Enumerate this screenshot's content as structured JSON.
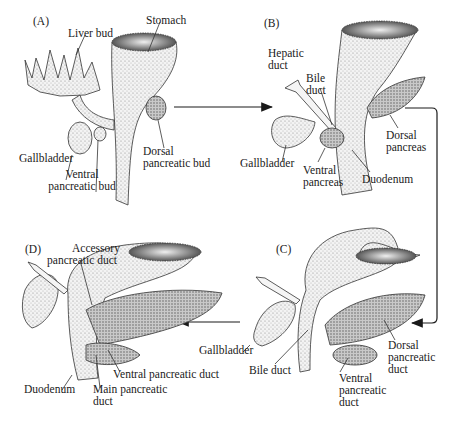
{
  "figure": {
    "panels": [
      {
        "id": "A",
        "label": "(A)",
        "annotations": {
          "liver_bud": "Liver bud",
          "stomach": "Stomach",
          "gallbladder": "Gallbladder",
          "ventral_bud_1": "Ventral",
          "ventral_bud_2": "pancreatic bud",
          "dorsal_bud_1": "Dorsal",
          "dorsal_bud_2": "pancreatic bud"
        }
      },
      {
        "id": "B",
        "label": "(B)",
        "annotations": {
          "hepatic_1": "Hepatic",
          "hepatic_2": "duct",
          "bile_1": "Bile",
          "bile_2": "duct",
          "gallbladder": "Gallbladder",
          "ventral_1": "Ventral",
          "ventral_2": "pancreas",
          "duodenum": "Duodenum",
          "dorsal_1": "Dorsal",
          "dorsal_2": "pancreas"
        }
      },
      {
        "id": "C",
        "label": "(C)",
        "annotations": {
          "gallbladder": "Gallbladder",
          "bile_duct": "Bile duct",
          "ventral_1": "Ventral",
          "ventral_2": "pancreatic",
          "ventral_3": "duct",
          "dorsal_1": "Dorsal",
          "dorsal_2": "pancreatic",
          "dorsal_3": "duct"
        }
      },
      {
        "id": "D",
        "label": "(D)",
        "annotations": {
          "accessory_1": "Accessory",
          "accessory_2": "pancreatic duct",
          "ventral_duct": "Ventral pancreatic duct",
          "duodenum": "Duodenum",
          "main_1": "Main pancreatic",
          "main_2": "duct"
        }
      }
    ],
    "flow": [
      "A",
      "B",
      "C",
      "D"
    ],
    "colors": {
      "ink": "#1a1a1a",
      "tissue_light": "#e9e9e9",
      "tissue_dark": "#9a9a9a",
      "background": "#ffffff"
    }
  }
}
